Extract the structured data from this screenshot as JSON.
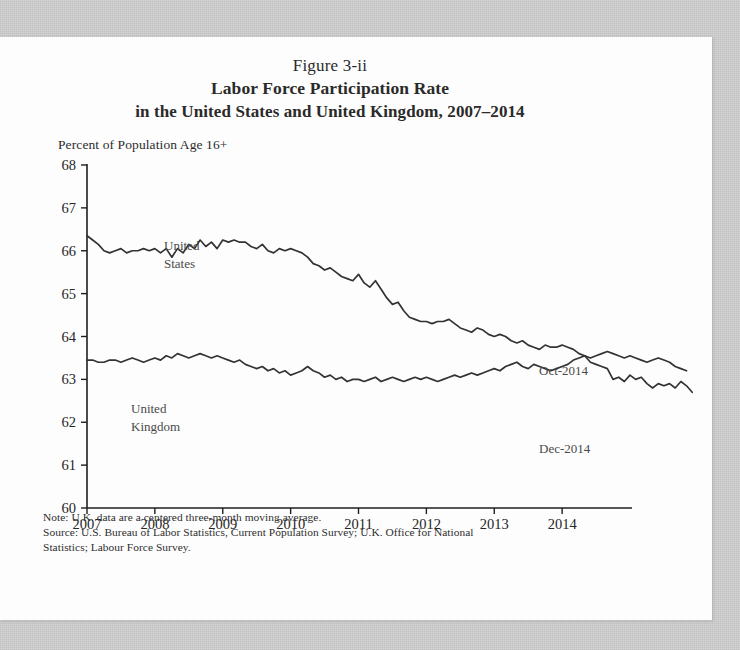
{
  "figure": {
    "number_line": "Figure 3-ii",
    "title": "Labor Force Participation Rate",
    "subtitle": "in the United States and United Kingdom, 2007–2014",
    "y_axis_caption": "Percent of Population Age 16+",
    "note": "Note: U.K. data are a centered three-month moving average.",
    "source_line1": "Source: U.S. Bureau of Labor Statistics, Current Population Survey; U.K. Office for National",
    "source_line2": "Statistics;  Labour Force Survey."
  },
  "colors": {
    "line": "#333333",
    "axis": "#1f1f1f",
    "label": "#4a4a4a",
    "paper": "#fdfdfd",
    "scan_background": "#cfcfcf"
  },
  "annotations": {
    "us_series_label_line1": "United",
    "us_series_label_line2": "States",
    "uk_series_label_line1": "United",
    "uk_series_label_line2": "Kingdom",
    "uk_endpoint_label": "Oct-2014",
    "us_endpoint_label": "Dec-2014"
  },
  "chart_data": {
    "type": "line",
    "title": "Labor Force Participation Rate in the United States and United Kingdom, 2007–2014",
    "xlabel": "",
    "ylabel": "Percent of Population Age 16+",
    "ylim": [
      60,
      68
    ],
    "yticks": [
      60,
      61,
      62,
      63,
      64,
      65,
      66,
      67,
      68
    ],
    "xlim": [
      2007.0,
      2015.0
    ],
    "xticks": [
      2007,
      2008,
      2009,
      2010,
      2011,
      2012,
      2013,
      2014
    ],
    "xtick_labels": [
      "2007",
      "2008",
      "2009",
      "2010",
      "2011",
      "2012",
      "2013",
      "2014"
    ],
    "grid": false,
    "legend": "inline-labels",
    "x_step": 0.08333,
    "series": [
      {
        "name": "United States",
        "label_position": "upper-left",
        "end_label": "Dec-2014",
        "x_start": 2007.0,
        "values": [
          66.35,
          66.25,
          66.15,
          66.0,
          65.95,
          66.0,
          66.05,
          65.95,
          66.0,
          66.0,
          66.05,
          66.0,
          66.05,
          65.95,
          66.05,
          65.85,
          66.05,
          65.95,
          66.15,
          66.05,
          66.25,
          66.1,
          66.2,
          66.05,
          66.25,
          66.2,
          66.25,
          66.2,
          66.2,
          66.1,
          66.05,
          66.15,
          66.0,
          65.95,
          66.05,
          66.0,
          66.05,
          66.0,
          65.95,
          65.85,
          65.7,
          65.65,
          65.55,
          65.6,
          65.5,
          65.4,
          65.35,
          65.3,
          65.45,
          65.25,
          65.15,
          65.3,
          65.1,
          64.9,
          64.75,
          64.8,
          64.6,
          64.45,
          64.4,
          64.35,
          64.35,
          64.3,
          64.35,
          64.35,
          64.4,
          64.3,
          64.2,
          64.15,
          64.1,
          64.2,
          64.15,
          64.05,
          64.0,
          64.05,
          64.0,
          63.9,
          63.85,
          63.9,
          63.8,
          63.75,
          63.7,
          63.8,
          63.75,
          63.75,
          63.8,
          63.75,
          63.7,
          63.6,
          63.55,
          63.4,
          63.35,
          63.3,
          63.25,
          63.0,
          63.05,
          62.95,
          63.1,
          63.0,
          63.05,
          62.9,
          62.8,
          62.9,
          62.85,
          62.9,
          62.8,
          62.95,
          62.85,
          62.7
        ]
      },
      {
        "name": "United Kingdom",
        "label_position": "lower-left",
        "end_label": "Oct-2014",
        "x_start": 2007.0,
        "values": [
          63.45,
          63.45,
          63.4,
          63.4,
          63.45,
          63.45,
          63.4,
          63.45,
          63.5,
          63.45,
          63.4,
          63.45,
          63.5,
          63.45,
          63.55,
          63.5,
          63.6,
          63.55,
          63.5,
          63.55,
          63.6,
          63.55,
          63.5,
          63.55,
          63.5,
          63.45,
          63.4,
          63.45,
          63.35,
          63.3,
          63.25,
          63.3,
          63.2,
          63.25,
          63.15,
          63.2,
          63.1,
          63.15,
          63.2,
          63.3,
          63.2,
          63.15,
          63.05,
          63.1,
          63.0,
          63.05,
          62.95,
          63.0,
          63.0,
          62.95,
          63.0,
          63.05,
          62.95,
          63.0,
          63.05,
          63.0,
          62.95,
          63.0,
          63.05,
          63.0,
          63.05,
          63.0,
          62.95,
          63.0,
          63.05,
          63.1,
          63.05,
          63.1,
          63.15,
          63.1,
          63.15,
          63.2,
          63.25,
          63.2,
          63.3,
          63.35,
          63.4,
          63.3,
          63.25,
          63.35,
          63.3,
          63.25,
          63.2,
          63.25,
          63.3,
          63.35,
          63.45,
          63.5,
          63.55,
          63.5,
          63.55,
          63.6,
          63.65,
          63.6,
          63.55,
          63.5,
          63.55,
          63.5,
          63.45,
          63.4,
          63.45,
          63.5,
          63.45,
          63.4,
          63.3,
          63.25,
          63.2
        ]
      }
    ]
  }
}
